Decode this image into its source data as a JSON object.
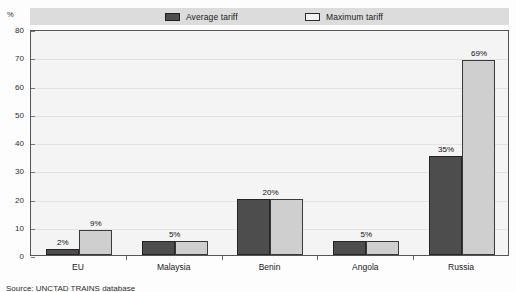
{
  "axis_unit": "%",
  "legend": {
    "entries": [
      {
        "label": "Average tariff",
        "swatch": "dark-swatch-icon",
        "color": "#4d4d4d"
      },
      {
        "label": "Maximum tariff",
        "swatch": "light-swatch-icon",
        "color": "#f2f2f2"
      }
    ]
  },
  "source_note": "Source:  UNCTAD TRAINS database",
  "colors": {
    "average_bar": "#4d4d4d",
    "maximum_bar": "#cfcfcf",
    "legend_band": "#dcdcdc",
    "plot_background": "#f4f4f4",
    "frame": "#555555"
  },
  "chart_data": {
    "type": "bar",
    "title": "",
    "xlabel": "",
    "ylabel": "%",
    "ylim": [
      0,
      80
    ],
    "yticks": [
      0,
      10,
      20,
      30,
      40,
      50,
      60,
      70,
      80
    ],
    "grid": true,
    "legend_position": "top",
    "categories": [
      "EU",
      "Malaysia",
      "Benin",
      "Angola",
      "Russia"
    ],
    "series": [
      {
        "name": "Average tariff",
        "values": [
          2,
          5,
          20,
          5,
          35
        ],
        "labels": [
          "2%",
          "5%",
          "20%",
          "5%",
          "35%"
        ]
      },
      {
        "name": "Maximum tariff",
        "values": [
          9,
          5,
          20,
          5,
          69
        ],
        "labels": [
          "9%",
          "5%",
          "20%",
          "5%",
          "69%"
        ]
      }
    ],
    "data_labels": [
      {
        "category": "EU",
        "average": "2%",
        "maximum": "9%",
        "shared": false
      },
      {
        "category": "Malaysia",
        "average": "5%",
        "maximum": "5%",
        "shared": true,
        "shared_label": "5%"
      },
      {
        "category": "Benin",
        "average": "20%",
        "maximum": "20%",
        "shared": true,
        "shared_label": "20%"
      },
      {
        "category": "Angola",
        "average": "5%",
        "maximum": "5%",
        "shared": true,
        "shared_label": "5%"
      },
      {
        "category": "Russia",
        "average": "35%",
        "maximum": "69%",
        "shared": false
      }
    ]
  }
}
